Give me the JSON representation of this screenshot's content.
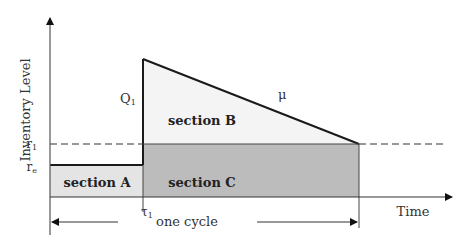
{
  "diagram": {
    "y_axis_label": "Inventory Level",
    "x_axis_label": "Time",
    "labels": {
      "r1": "r",
      "r1_sub": "1",
      "re": "r",
      "re_sub": "e",
      "Q1": "Q",
      "Q1_sub": "1",
      "mu": "μ",
      "tau1": "τ",
      "tau1_sub": "1"
    },
    "sections": {
      "a": "section A",
      "b": "section B",
      "c": "section C"
    },
    "cycle_label": "one cycle",
    "colors": {
      "section_a_fill": "#e4e4e4",
      "section_b_fill": "#f4f4f4",
      "section_c_fill": "#bcbcbc",
      "line": "#1a1a1a"
    }
  }
}
